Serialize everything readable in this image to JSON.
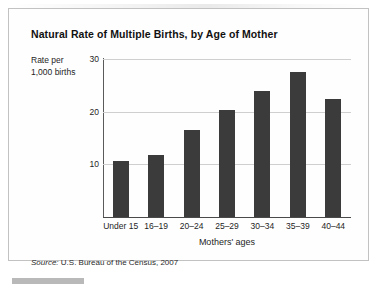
{
  "figure": {
    "title": "Natural Rate of Multiple Births, by Age of Mother",
    "y_axis_caption_line1": "Rate per",
    "y_axis_caption_line2": "1,000 births",
    "x_axis_title": "Mothers' ages",
    "source_label": "Source:",
    "source_text": " U.S. Bureau of the Census, 2007",
    "bar_color": "#3b3b3b",
    "gridline_color": "#cfcfcf",
    "border_color": "#c2c2c2"
  },
  "chart_data": {
    "type": "bar",
    "title": "Natural Rate of Multiple Births, by Age of Mother",
    "xlabel": "Mothers' ages",
    "ylabel": "Rate per 1,000 births",
    "categories": [
      "Under 15",
      "16–19",
      "20–24",
      "25–29",
      "30–34",
      "35–39",
      "40–44"
    ],
    "values": [
      10.6,
      11.8,
      16.5,
      20.3,
      24.0,
      27.5,
      22.4
    ],
    "ylim": [
      0,
      30
    ],
    "yticks": [
      10,
      20,
      30
    ],
    "ytick_labels": [
      "10",
      "20",
      "30"
    ],
    "grid": true,
    "legend": "none",
    "source": "Source: U.S. Bureau of the Census, 2007"
  }
}
